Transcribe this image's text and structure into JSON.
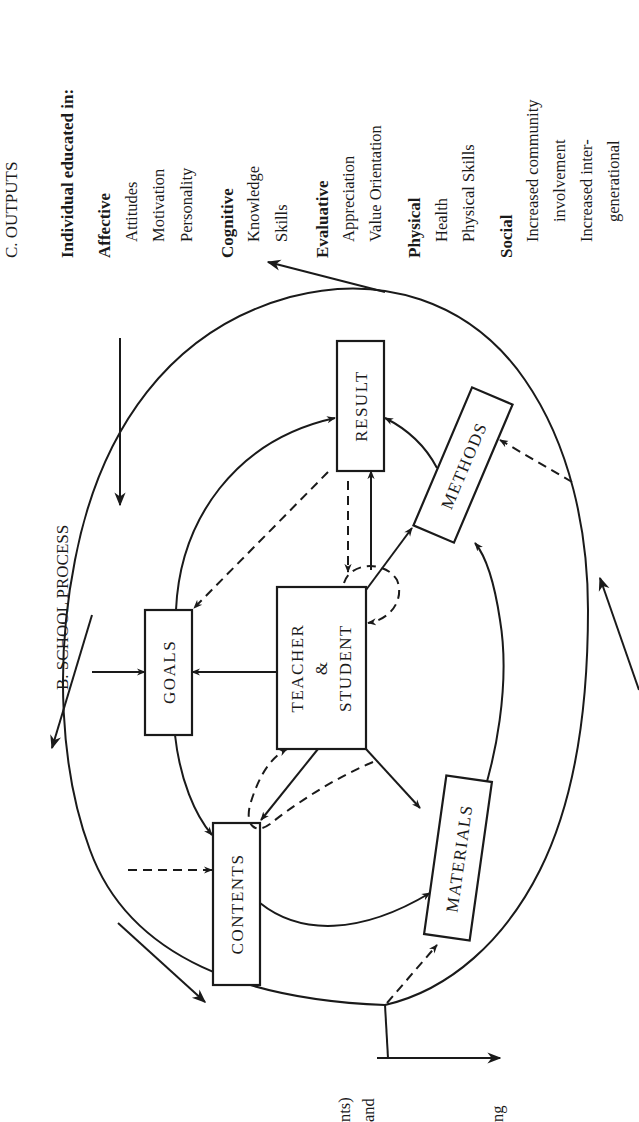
{
  "page": {
    "orientation": "rotated 90 degrees counter-clockwise",
    "background": "#ffffff",
    "ink": "#1a1a1a"
  },
  "section_b": {
    "title": "B. SCHOOL PROCESS"
  },
  "section_c": {
    "title": "C. OUTPUTS",
    "heading": "Individual educated in:",
    "groups": [
      {
        "label": "Affective",
        "items": [
          "Attitudes",
          "Motivation",
          "Personality"
        ]
      },
      {
        "label": "Cognitive",
        "items": [
          "Knowledge",
          "Skills"
        ]
      },
      {
        "label": "Evaluative",
        "items": [
          "Appreciation",
          "Value Orientation"
        ]
      },
      {
        "label": "Physical",
        "items": [
          "Health",
          "Physical Skills"
        ]
      },
      {
        "label": "Social",
        "items": [
          "Increased community",
          "involvement",
          "Increased inter-",
          "generational"
        ]
      }
    ]
  },
  "boxes": {
    "goals": "GOALS",
    "teacher_line1": "TEACHER",
    "teacher_line2": "&",
    "teacher_line3": "STUDENT",
    "result": "RESULT",
    "contents": "CONTENTS",
    "methods": "METHODS",
    "materials": "MATERIALS"
  },
  "cropped_text": {
    "line1": "nts)",
    "line2": "and",
    "line3": "ng"
  }
}
